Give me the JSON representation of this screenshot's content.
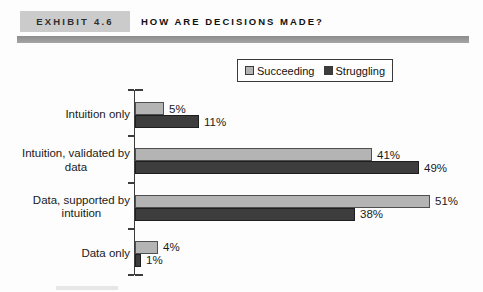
{
  "header": {
    "exhibit_label": "EXHIBIT 4.6",
    "title": "HOW ARE DECISIONS MADE?"
  },
  "chart_data": {
    "type": "bar",
    "orientation": "horizontal",
    "title": "HOW ARE DECISIONS MADE?",
    "categories": [
      "Intuition only",
      "Intuition, validated by\ndata",
      "Data, supported by\nintuition",
      "Data only"
    ],
    "series": [
      {
        "name": "Succeeding",
        "values": [
          5,
          41,
          51,
          4
        ],
        "color": "#b4b4b4",
        "border_color": "#4f4f4f"
      },
      {
        "name": "Struggling",
        "values": [
          11,
          49,
          38,
          1
        ],
        "color": "#3d3d3d",
        "border_color": "#1e1e1e"
      }
    ],
    "value_suffix": "%",
    "value_labels": true,
    "xlim": [
      0,
      57
    ],
    "legend_position": "top",
    "grid": false
  },
  "colors": {
    "exhibit_box_bg": "#cbcbcb",
    "header_rule": "#969696",
    "axis": "#3c3c3c",
    "text": "#1a1a1a",
    "page_bg": "#fdfdfd"
  }
}
